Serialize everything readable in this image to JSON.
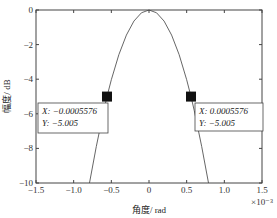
{
  "chart_data": {
    "type": "line",
    "title": "",
    "xlabel": "角度/ rad",
    "ylabel": "幅度/ dB",
    "x_exponent_label": "×10⁻³",
    "xlim": [
      -1.5,
      1.5
    ],
    "ylim": [
      -10,
      0
    ],
    "x_ticks": [
      -1.5,
      -1.0,
      -0.5,
      0,
      0.5,
      1.0,
      1.5
    ],
    "x_tick_labels": [
      "−1.5",
      "−1.0",
      "−0.5",
      "0",
      "0.5",
      "1.0",
      "1.5"
    ],
    "y_ticks": [
      0,
      -2,
      -4,
      -6,
      -8,
      -10
    ],
    "y_tick_labels": [
      "0",
      "−2",
      "−4",
      "−6",
      "−8",
      "−10"
    ],
    "grid": false,
    "series": [
      {
        "name": "beam pattern",
        "x_scale": 0.001,
        "x": [
          -0.79,
          -0.7,
          -0.6,
          -0.5576,
          -0.5,
          -0.4,
          -0.3,
          -0.2,
          -0.1,
          0,
          0.1,
          0.2,
          0.3,
          0.4,
          0.5,
          0.5576,
          0.6,
          0.7,
          0.79
        ],
        "y": [
          -10,
          -7.9,
          -5.8,
          -5.005,
          -4.03,
          -2.58,
          -1.45,
          -0.64,
          -0.16,
          0,
          -0.16,
          -0.64,
          -1.45,
          -2.58,
          -4.03,
          -5.005,
          -5.8,
          -7.9,
          -10
        ]
      }
    ],
    "annotations": [
      {
        "x_text": "X: −0.0005576",
        "y_text": "Y: −5.005",
        "x": -0.0005576,
        "y": -5.005
      },
      {
        "x_text": "X: 0.0005576",
        "y_text": "Y: −5.005",
        "x": 0.0005576,
        "y": -5.005
      }
    ]
  }
}
